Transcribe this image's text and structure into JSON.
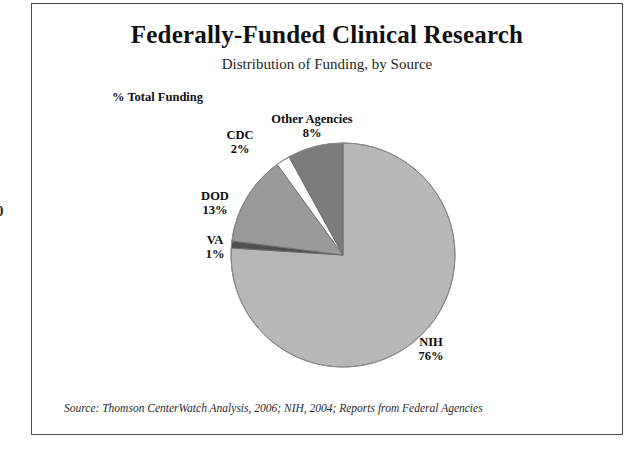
{
  "page_artifact": {
    "clipped_digit": "0"
  },
  "slide": {
    "title": "Federally-Funded Clinical Research",
    "subtitle": "Distribution of Funding, by Source",
    "axis_note": "% Total Funding",
    "source_note": "Source: Thomson CenterWatch Analysis, 2006; NIH, 2004; Reports from Federal Agencies"
  },
  "chart_data": {
    "type": "pie",
    "title": "Federally-Funded Clinical Research",
    "subtitle": "Distribution of Funding, by Source",
    "value_axis_label": "% Total Funding",
    "units": "percent",
    "start_angle_deg": 0,
    "direction": "clockwise",
    "legend": "none",
    "grid": false,
    "labels_on_slices": true,
    "total": 100,
    "categories": [
      "NIH",
      "VA",
      "DOD",
      "CDC",
      "Other Agencies"
    ],
    "values": [
      76,
      1,
      13,
      2,
      8
    ],
    "colors": [
      "#b7b7b7",
      "#4f4f4f",
      "#9a9a9a",
      "#fdfdfd",
      "#7c7c7c"
    ],
    "slices": [
      {
        "name": "NIH",
        "value": 76,
        "value_label": "76%",
        "color": "#b7b7b7",
        "start_deg": 0,
        "end_deg": 273.6
      },
      {
        "name": "VA",
        "value": 1,
        "value_label": "1%",
        "color": "#4f4f4f",
        "start_deg": 273.6,
        "end_deg": 277.2
      },
      {
        "name": "DOD",
        "value": 13,
        "value_label": "13%",
        "color": "#9a9a9a",
        "start_deg": 277.2,
        "end_deg": 324.0
      },
      {
        "name": "CDC",
        "value": 2,
        "value_label": "2%",
        "color": "#fdfdfd",
        "start_deg": 324.0,
        "end_deg": 331.2
      },
      {
        "name": "Other Agencies",
        "value": 8,
        "value_label": "8%",
        "color": "#7c7c7c",
        "start_deg": 331.2,
        "end_deg": 360.0
      }
    ],
    "source": "Source: Thomson CenterWatch Analysis, 2006; NIH, 2004; Reports from Federal Agencies"
  }
}
